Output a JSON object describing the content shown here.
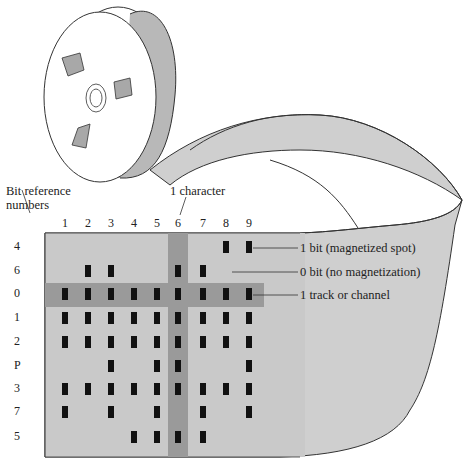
{
  "labels": {
    "bit_reference_line1": "Bit reference",
    "bit_reference_line2": "numbers",
    "one_character": "1 character",
    "one_bit": "1 bit (magnetized spot)",
    "zero_bit": "0 bit (no magnetization)",
    "track": "1 track or channel"
  },
  "columns": [
    "1",
    "2",
    "3",
    "4",
    "5",
    "6",
    "7",
    "8",
    "9"
  ],
  "rows": [
    "4",
    "6",
    "0",
    "1",
    "2",
    "P",
    "3",
    "7",
    "5"
  ],
  "highlighted_column": "6",
  "highlighted_row": "0",
  "bits": {
    "4": [
      0,
      0,
      0,
      0,
      0,
      0,
      0,
      1,
      1
    ],
    "6": [
      0,
      1,
      1,
      0,
      0,
      1,
      1,
      0,
      0
    ],
    "0": [
      1,
      1,
      1,
      1,
      1,
      1,
      1,
      1,
      1
    ],
    "1": [
      1,
      1,
      1,
      1,
      1,
      1,
      1,
      1,
      1
    ],
    "2": [
      1,
      1,
      1,
      1,
      1,
      1,
      1,
      1,
      1
    ],
    "P": [
      0,
      0,
      1,
      0,
      1,
      1,
      0,
      0,
      1
    ],
    "3": [
      1,
      1,
      1,
      1,
      1,
      1,
      1,
      1,
      1
    ],
    "7": [
      1,
      0,
      1,
      0,
      1,
      0,
      1,
      0,
      1
    ],
    "5": [
      0,
      0,
      0,
      1,
      1,
      1,
      1,
      0,
      0
    ]
  },
  "colors": {
    "tape": "#c9c9c9",
    "highlight": "#9a9a9a",
    "bit": "#111111",
    "reel_window": "#a8a8a8"
  }
}
